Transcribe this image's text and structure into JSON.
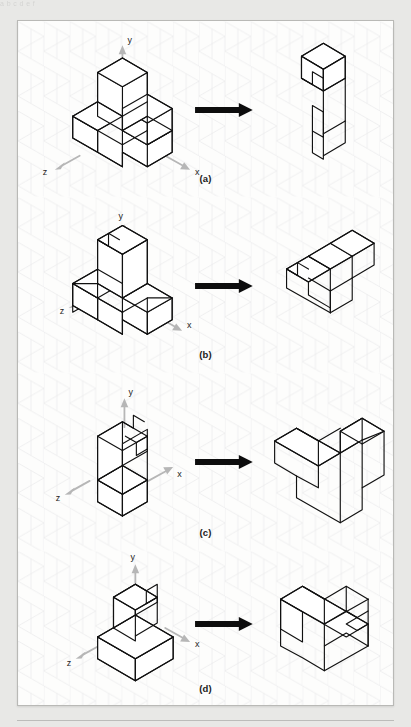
{
  "figure": {
    "kind": "isometric-block-rotation-exercise",
    "bleed_text": "a  b        c          d                e         f",
    "panels": [
      {
        "id": "a",
        "caption": "(a)",
        "axes": {
          "y": "y",
          "x": "x",
          "z": "z"
        },
        "left_shape": "staircase-of-cubes",
        "arrow": "right-arrow",
        "right_shape": "rotated-L-block-with-notch"
      },
      {
        "id": "b",
        "caption": "(b)",
        "axes": {
          "y": "y",
          "x": "x",
          "z": "z"
        },
        "left_shape": "three-cube-L-with-tall-riser",
        "arrow": "right-arrow",
        "right_shape": "rotated-flat-L-block"
      },
      {
        "id": "c",
        "caption": "(c)",
        "axes": {
          "y": "y",
          "x": "x",
          "z": "z"
        },
        "left_shape": "tall-slab-with-step",
        "arrow": "right-arrow",
        "right_shape": "rotated-T-block"
      },
      {
        "id": "d",
        "caption": "(d)",
        "axes": {
          "y": "y",
          "x": "x",
          "z": "z"
        },
        "left_shape": "base-block-with-upright-tower",
        "arrow": "right-arrow",
        "right_shape": "rotated-block-with-square-notch"
      }
    ],
    "colors": {
      "page_background": "#e8e8e6",
      "figure_background": "#fdfdfc",
      "figure_border": "#b9b9b6",
      "grid": "#e4e4e6",
      "edge": "#111111",
      "axis_arrow": "#b6b6b6",
      "transform_arrow": "#0d0d0d",
      "caption_text": "#1a1a1a"
    }
  }
}
